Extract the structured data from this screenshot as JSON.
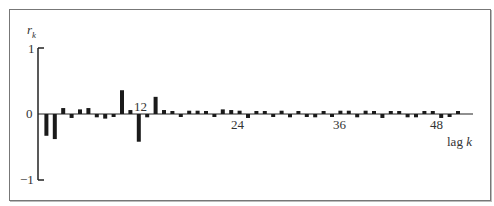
{
  "chart_data": {
    "type": "bar",
    "title": "",
    "ylabel": "r_k",
    "xlabel": "lag k",
    "ylim": [
      -1,
      1
    ],
    "yticks": [
      1,
      0,
      -1
    ],
    "xticks": [
      12,
      24,
      36,
      48
    ],
    "grid": false,
    "legend": null,
    "x": [
      1,
      2,
      3,
      4,
      5,
      6,
      7,
      8,
      9,
      10,
      11,
      12,
      13,
      14,
      15,
      16,
      17,
      18,
      19,
      20,
      21,
      22,
      23,
      24,
      25,
      26,
      27,
      28,
      29,
      30,
      31,
      32,
      33,
      34,
      35,
      36,
      37,
      38,
      39,
      40,
      41,
      42,
      43,
      44,
      45,
      46,
      47,
      48,
      49,
      50
    ],
    "values": [
      -0.33,
      -0.38,
      0.09,
      -0.06,
      0.07,
      0.09,
      -0.05,
      -0.07,
      -0.03,
      0.36,
      0.06,
      -0.42,
      -0.05,
      0.26,
      0.06,
      0.04,
      -0.03,
      0.05,
      0.05,
      0.04,
      -0.04,
      0.07,
      0.06,
      0.05,
      -0.06,
      0.04,
      0.04,
      -0.04,
      0.05,
      -0.05,
      0.04,
      -0.04,
      -0.05,
      0.04,
      -0.03,
      0.05,
      0.05,
      -0.05,
      0.05,
      0.04,
      -0.06,
      0.04,
      0.04,
      -0.05,
      -0.05,
      0.04,
      0.04,
      -0.06,
      -0.03,
      0.04
    ]
  },
  "labels": {
    "y_axis": "r",
    "y_axis_sub": "k",
    "x_axis": "lag",
    "x_axis_var": "k",
    "ytick_1": "1",
    "ytick_0": "0",
    "ytick_m1": "−1",
    "xtick_12": "12",
    "xtick_24": "24",
    "xtick_36": "36",
    "xtick_48": "48"
  }
}
